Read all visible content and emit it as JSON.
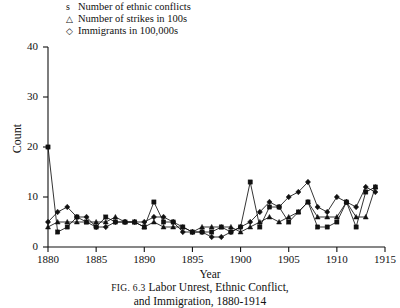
{
  "legend": {
    "entries": [
      {
        "marker": "s",
        "marker_name": "square-marker",
        "label": "Number of ethnic conflicts"
      },
      {
        "marker": "△",
        "marker_name": "triangle-marker",
        "label": "Number of strikes in 100s"
      },
      {
        "marker": "◇",
        "marker_name": "diamond-marker",
        "label": "Immigrants in 100,000s"
      }
    ]
  },
  "axes": {
    "ylabel": "Count",
    "xlabel": "Year",
    "yticks": [
      "0",
      "10",
      "20",
      "30",
      "40"
    ],
    "xticks": [
      "1880",
      "1885",
      "1890",
      "1895",
      "1900",
      "1905",
      "1910",
      "1915"
    ]
  },
  "caption": {
    "figure_number": "FIG. 6.3",
    "line1": "Labor Unrest, Ethnic Conflict,",
    "line2": "and Immigration, 1880-1914"
  },
  "colors": {
    "ink": "#111111",
    "background": "#ffffff"
  },
  "chart_data": {
    "type": "line",
    "title": "Labor Unrest, Ethnic Conflict, and Immigration, 1880-1914",
    "xlabel": "Year",
    "ylabel": "Count",
    "xlim": [
      1880,
      1915
    ],
    "ylim": [
      0,
      40
    ],
    "grid": false,
    "legend_position": "above-plot-left",
    "x": [
      1880,
      1881,
      1882,
      1883,
      1884,
      1885,
      1886,
      1887,
      1888,
      1889,
      1890,
      1891,
      1892,
      1893,
      1894,
      1895,
      1896,
      1897,
      1898,
      1899,
      1900,
      1901,
      1902,
      1903,
      1904,
      1905,
      1906,
      1907,
      1908,
      1909,
      1910,
      1911,
      1912,
      1913,
      1914
    ],
    "series": [
      {
        "name": "Number of ethnic conflicts",
        "marker": "square",
        "values": [
          20,
          3,
          4,
          6,
          5,
          4,
          6,
          5,
          5,
          5,
          4,
          9,
          5,
          5,
          4,
          3,
          3,
          3,
          4,
          3,
          4,
          13,
          4,
          8,
          8,
          5,
          7,
          9,
          4,
          4,
          5,
          9,
          4,
          11,
          12
        ]
      },
      {
        "name": "Number of strikes in 100s",
        "marker": "triangle",
        "values": [
          4,
          5,
          5,
          5,
          5,
          5,
          5,
          6,
          5,
          5,
          4,
          5,
          4,
          4,
          4,
          3,
          4,
          4,
          4,
          4,
          3,
          4,
          5,
          6,
          5,
          6,
          7,
          9,
          6,
          6,
          6,
          9,
          6,
          6,
          12
        ]
      },
      {
        "name": "Immigrants in 100,000s",
        "marker": "diamond",
        "values": [
          5,
          7,
          8,
          6,
          6,
          4,
          4,
          5,
          5,
          5,
          5,
          6,
          6,
          5,
          3,
          3,
          3,
          2,
          2,
          3,
          4,
          5,
          7,
          9,
          8,
          10,
          11,
          13,
          8,
          7,
          10,
          9,
          8,
          12,
          11
        ]
      }
    ]
  },
  "plot_geometry": {
    "x_left_px": 48,
    "x_right_px": 385,
    "y_zero_px": 247,
    "y_top_px": 47,
    "x_min_year": 1880,
    "x_max_year": 1915,
    "y_min": 0,
    "y_max": 40
  }
}
